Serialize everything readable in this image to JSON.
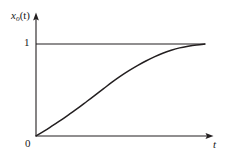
{
  "figure": {
    "background_color": "#ffffff",
    "line_color": "#231f20",
    "width": 231,
    "height": 160
  },
  "labels": {
    "y_axis_var": "x",
    "y_axis_subscript": "o",
    "y_axis_arg": "(t)",
    "x_axis": "t",
    "tick_one": "1",
    "tick_zero": "0"
  },
  "chart_data": {
    "type": "line",
    "title": "",
    "xlabel": "t",
    "ylabel": "x_o(t)",
    "grid": false,
    "legend": null,
    "xlim": [
      0,
      1
    ],
    "ylim": [
      0,
      1.08
    ],
    "annotations": [
      {
        "text": "1",
        "kind": "y-tick",
        "value": 1
      },
      {
        "text": "0",
        "kind": "origin",
        "value": 0
      }
    ],
    "reference_lines": [
      {
        "orientation": "horizontal",
        "y": 1,
        "label": "1",
        "style": "solid"
      }
    ],
    "series": [
      {
        "name": "step response",
        "description": "monotonic S-shaped rise from 0 saturating at 1",
        "x": [
          0.0,
          0.05,
          0.1,
          0.15,
          0.2,
          0.25,
          0.3,
          0.35,
          0.4,
          0.45,
          0.5,
          0.55,
          0.6,
          0.65,
          0.7,
          0.75,
          0.8,
          0.85,
          0.9,
          0.95,
          1.0
        ],
        "y": [
          0.0,
          0.055,
          0.115,
          0.175,
          0.24,
          0.305,
          0.375,
          0.445,
          0.515,
          0.585,
          0.65,
          0.71,
          0.765,
          0.815,
          0.86,
          0.9,
          0.932,
          0.958,
          0.976,
          0.99,
          1.0
        ]
      }
    ]
  }
}
